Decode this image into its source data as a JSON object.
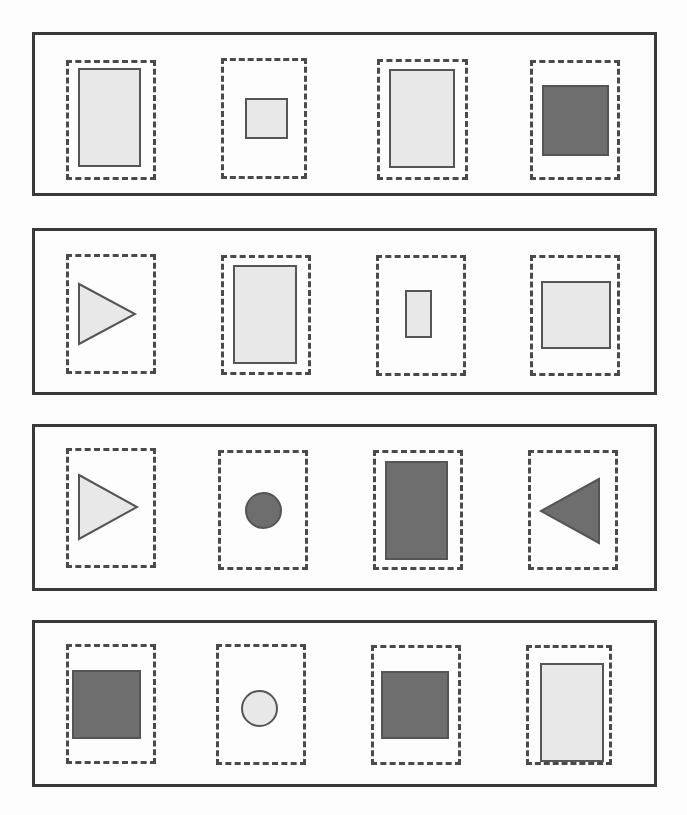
{
  "canvas": {
    "width": 687,
    "height": 815,
    "background": "#fdfdfd"
  },
  "style": {
    "panel_border_color": "#3a3a3a",
    "panel_border_width": 3,
    "dash_border_color": "#4a4a4a",
    "dash_border_width": 3,
    "shape_stroke_color": "#555555",
    "shape_stroke_width": 2,
    "fill_light": "#e8e8e8",
    "fill_dark": "#6e6e6e"
  },
  "panels": [
    {
      "name": "panel-row-1",
      "x": 32,
      "y": 32,
      "width": 625,
      "height": 164,
      "cells": [
        {
          "name": "cell-r1c1",
          "dash": {
            "x": 66,
            "y": 60,
            "width": 90,
            "height": 120
          },
          "shape": {
            "type": "rect",
            "fill": "light",
            "x": 78,
            "y": 68,
            "width": 63,
            "height": 99
          }
        },
        {
          "name": "cell-r1c2",
          "dash": {
            "x": 221,
            "y": 58,
            "width": 86,
            "height": 121
          },
          "shape": {
            "type": "rect",
            "fill": "light",
            "x": 245,
            "y": 98,
            "width": 43,
            "height": 41
          }
        },
        {
          "name": "cell-r1c3",
          "dash": {
            "x": 377,
            "y": 59,
            "width": 91,
            "height": 121
          },
          "shape": {
            "type": "rect",
            "fill": "light",
            "x": 389,
            "y": 69,
            "width": 66,
            "height": 99
          }
        },
        {
          "name": "cell-r1c4",
          "dash": {
            "x": 530,
            "y": 60,
            "width": 90,
            "height": 120
          },
          "shape": {
            "type": "rect",
            "fill": "dark",
            "x": 542,
            "y": 85,
            "width": 67,
            "height": 71
          }
        }
      ]
    },
    {
      "name": "panel-row-2",
      "x": 32,
      "y": 228,
      "width": 625,
      "height": 167,
      "cells": [
        {
          "name": "cell-r2c1",
          "dash": {
            "x": 66,
            "y": 254,
            "width": 90,
            "height": 120
          },
          "shape": {
            "type": "triangle",
            "direction": "right",
            "fill": "light",
            "x": 78,
            "y": 283,
            "width": 58,
            "height": 62
          }
        },
        {
          "name": "cell-r2c2",
          "dash": {
            "x": 221,
            "y": 255,
            "width": 90,
            "height": 120
          },
          "shape": {
            "type": "rect",
            "fill": "light",
            "x": 233,
            "y": 265,
            "width": 64,
            "height": 99
          }
        },
        {
          "name": "cell-r2c3",
          "dash": {
            "x": 376,
            "y": 255,
            "width": 90,
            "height": 121
          },
          "shape": {
            "type": "rect",
            "fill": "light",
            "x": 405,
            "y": 290,
            "width": 27,
            "height": 48
          }
        },
        {
          "name": "cell-r2c4",
          "dash": {
            "x": 530,
            "y": 255,
            "width": 90,
            "height": 121
          },
          "shape": {
            "type": "rect",
            "fill": "light",
            "x": 541,
            "y": 281,
            "width": 70,
            "height": 68
          }
        }
      ]
    },
    {
      "name": "panel-row-3",
      "x": 32,
      "y": 424,
      "width": 625,
      "height": 167,
      "cells": [
        {
          "name": "cell-r3c1",
          "dash": {
            "x": 66,
            "y": 448,
            "width": 90,
            "height": 120
          },
          "shape": {
            "type": "triangle",
            "direction": "right",
            "fill": "light",
            "x": 78,
            "y": 474,
            "width": 60,
            "height": 66
          }
        },
        {
          "name": "cell-r3c2",
          "dash": {
            "x": 218,
            "y": 450,
            "width": 90,
            "height": 120
          },
          "shape": {
            "type": "circle",
            "fill": "dark",
            "x": 245,
            "y": 492,
            "width": 37,
            "height": 37
          }
        },
        {
          "name": "cell-r3c3",
          "dash": {
            "x": 373,
            "y": 450,
            "width": 90,
            "height": 120
          },
          "shape": {
            "type": "rect",
            "fill": "dark",
            "x": 385,
            "y": 461,
            "width": 63,
            "height": 99
          }
        },
        {
          "name": "cell-r3c4",
          "dash": {
            "x": 528,
            "y": 450,
            "width": 90,
            "height": 120
          },
          "shape": {
            "type": "triangle",
            "direction": "left",
            "fill": "dark",
            "x": 540,
            "y": 478,
            "width": 60,
            "height": 66
          }
        }
      ]
    },
    {
      "name": "panel-row-4",
      "x": 32,
      "y": 620,
      "width": 625,
      "height": 167,
      "cells": [
        {
          "name": "cell-r4c1",
          "dash": {
            "x": 66,
            "y": 644,
            "width": 90,
            "height": 120
          },
          "shape": {
            "type": "rect",
            "fill": "dark",
            "x": 72,
            "y": 670,
            "width": 69,
            "height": 69
          }
        },
        {
          "name": "cell-r4c2",
          "dash": {
            "x": 216,
            "y": 644,
            "width": 90,
            "height": 121
          },
          "shape": {
            "type": "circle",
            "fill": "light",
            "x": 241,
            "y": 690,
            "width": 37,
            "height": 37
          }
        },
        {
          "name": "cell-r4c3",
          "dash": {
            "x": 371,
            "y": 645,
            "width": 90,
            "height": 120
          },
          "shape": {
            "type": "rect",
            "fill": "dark",
            "x": 381,
            "y": 671,
            "width": 68,
            "height": 68
          }
        },
        {
          "name": "cell-r4c4",
          "dash": {
            "x": 526,
            "y": 645,
            "width": 86,
            "height": 120
          },
          "shape": {
            "type": "rect",
            "fill": "light",
            "x": 540,
            "y": 663,
            "width": 64,
            "height": 99
          }
        }
      ]
    }
  ]
}
